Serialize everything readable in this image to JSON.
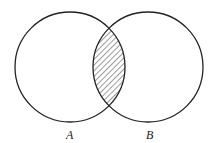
{
  "diagram": {
    "type": "venn",
    "sets": [
      {
        "id": "A",
        "label": "A",
        "cx": 70,
        "cy": 67,
        "r": 55
      },
      {
        "id": "B",
        "label": "B",
        "cx": 148,
        "cy": 67,
        "r": 55
      }
    ],
    "shaded_region": "A ∩ B",
    "shading": "diagonal-hatch",
    "stroke_color": "#222222"
  }
}
